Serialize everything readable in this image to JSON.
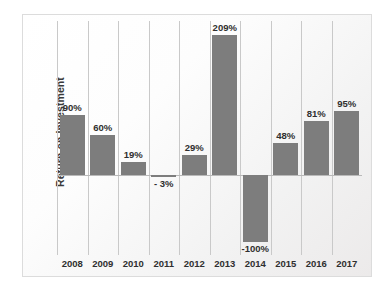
{
  "chart_data": {
    "type": "bar",
    "title": "",
    "subtitle": "",
    "xlabel": "",
    "ylabel": "Return on Investment",
    "categories": [
      "2008",
      "2009",
      "2010",
      "2011",
      "2012",
      "2013",
      "2014",
      "2015",
      "2016",
      "2017"
    ],
    "values": [
      90,
      60,
      19,
      -3,
      29,
      209,
      -100,
      48,
      81,
      95
    ],
    "data_labels": [
      "90%",
      "60%",
      "19%",
      "- 3%",
      "29%",
      "209%",
      "-100%",
      "48%",
      "81%",
      "95%"
    ],
    "ylim": [
      -120,
      230
    ],
    "zero_line": 0,
    "grid": "vertical",
    "legend": "none",
    "units": "percent",
    "colors": {
      "bar": "#7d7d7d",
      "gridline": "#c9c9c9",
      "zero_line": "#b9b9b9",
      "label_text": "#2f2f2f",
      "axis_title": "#3a3a3a",
      "plot_background": "#fbfbfb",
      "border": "#dcdcdc"
    }
  }
}
